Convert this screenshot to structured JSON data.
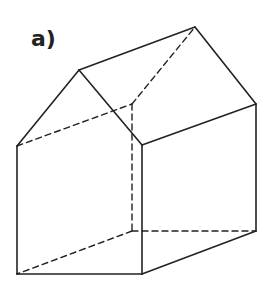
{
  "figure": {
    "label": "a)",
    "stroke_color": "#222222"
  },
  "vertices": {
    "front_peak": [
      79,
      70
    ],
    "front_left_eave": [
      17,
      146
    ],
    "front_bottom_left": [
      17,
      274
    ],
    "front_bottom_right": [
      142,
      274
    ],
    "front_right_eave": [
      142,
      145
    ],
    "back_peak": [
      195,
      27
    ],
    "back_right_eave": [
      256,
      104
    ],
    "back_bottom_right": [
      256,
      231
    ],
    "back_left_eave": [
      132,
      104
    ],
    "back_bottom_left": [
      132,
      231
    ]
  },
  "edges": {
    "solid": [
      [
        "front_peak",
        "front_left_eave"
      ],
      [
        "front_left_eave",
        "front_bottom_left"
      ],
      [
        "front_bottom_left",
        "front_bottom_right"
      ],
      [
        "front_bottom_right",
        "front_right_eave"
      ],
      [
        "front_right_eave",
        "front_peak"
      ],
      [
        "front_peak",
        "back_peak"
      ],
      [
        "back_peak",
        "back_right_eave"
      ],
      [
        "back_right_eave",
        "front_right_eave"
      ],
      [
        "back_right_eave",
        "back_bottom_right"
      ],
      [
        "back_bottom_right",
        "front_bottom_right"
      ]
    ],
    "dashed": [
      [
        "front_left_eave",
        "back_left_eave"
      ],
      [
        "back_left_eave",
        "back_peak"
      ],
      [
        "back_left_eave",
        "back_bottom_left"
      ],
      [
        "back_bottom_left",
        "front_bottom_left"
      ],
      [
        "back_bottom_left",
        "back_bottom_right"
      ]
    ]
  }
}
